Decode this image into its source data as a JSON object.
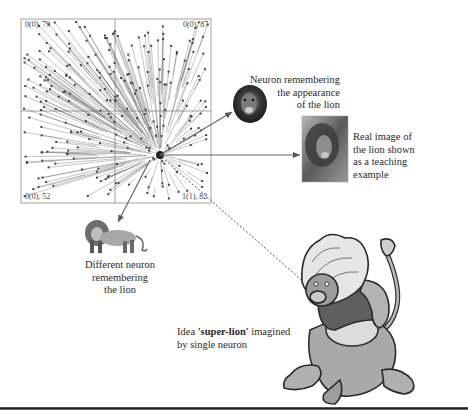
{
  "figure": {
    "type": "neuron-weight-vector-diagram",
    "plot": {
      "frame": {
        "x": 21,
        "y": 19,
        "width": 190,
        "height": 184
      },
      "dividers": {
        "vertical_x": 115,
        "horizontal_y": 111
      },
      "convergence_point": {
        "x": 160,
        "y": 155
      },
      "corner_labels": {
        "top_left": "0(0), 79",
        "top_right": "0(0), 87",
        "bottom_left": "0(0), 52",
        "bottom_right": "1(1), 82"
      },
      "colors": {
        "frame": "#888888",
        "vectors": "#555555",
        "points": "#444444"
      }
    },
    "annotations": {
      "neuron_appearance": {
        "lines": [
          "Neuron remembering",
          "the appearance",
          "of the lion"
        ],
        "icon": "lion-head-icon"
      },
      "real_image": {
        "lines": [
          "Real image of",
          "the lion shown",
          "as a teaching",
          "example"
        ],
        "icon": "lion-photo-icon"
      },
      "different_neuron": {
        "lines": [
          "Different neuron",
          "remembering",
          "the lion"
        ],
        "icon": "standing-lion-icon"
      },
      "super_lion": {
        "prefix": "Idea ",
        "bold": "'super-lion'",
        "suffix": " imagined",
        "line2": "by single neuron",
        "icon": "cartoon-super-lion-icon"
      }
    },
    "arrows": [
      {
        "name": "arrow-to-neuron-face",
        "from": [
          160,
          155
        ],
        "to": [
          232,
          112
        ],
        "style": "solid"
      },
      {
        "name": "arrow-to-real-image",
        "from": [
          160,
          155
        ],
        "to": [
          300,
          155
        ],
        "style": "solid"
      },
      {
        "name": "arrow-to-standing-lion",
        "from": [
          150,
          160
        ],
        "to": [
          118,
          222
        ],
        "style": "solid"
      },
      {
        "name": "arrow-to-super-lion",
        "from": [
          165,
          160
        ],
        "to": [
          306,
          284
        ],
        "style": "dashed"
      }
    ]
  }
}
